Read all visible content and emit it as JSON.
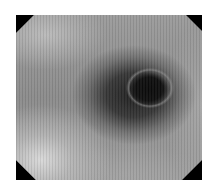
{
  "image": {
    "description": "Grayscale endoscopic view of a tubular lumen with a dark central opening and surrounding mucosal fold",
    "colors": {
      "background": "#ffffff",
      "frame_corners": "#000000",
      "lumen": "#0a0a0a",
      "fold_shadow": "#282828",
      "mucosa": "#8e8e8e",
      "highlight": "#dcdcdc"
    },
    "frame": {
      "x": 16,
      "y": 15,
      "width": 186,
      "height": 165,
      "shape": "octagon-clipped-corners"
    },
    "features": [
      {
        "name": "lumen",
        "center": [
          149,
          89
        ],
        "approx_size": [
          40,
          34
        ]
      },
      {
        "name": "dark-fold",
        "center": [
          134,
          95
        ],
        "approx_size": [
          124,
          100
        ]
      },
      {
        "name": "bright-region",
        "location": "lower-left"
      }
    ]
  }
}
